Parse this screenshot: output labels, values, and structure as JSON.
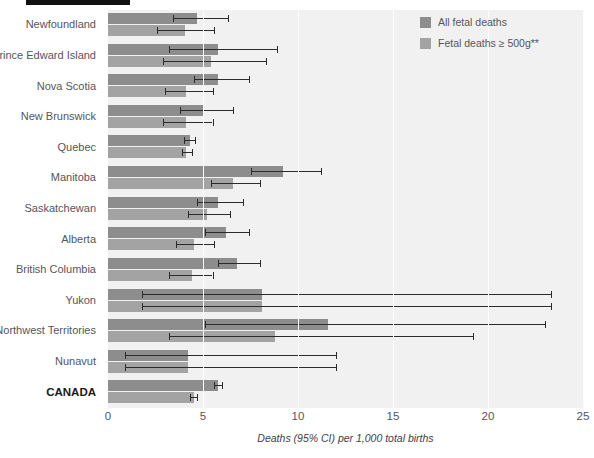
{
  "figure": {
    "title_tag": "",
    "title_clipped": "",
    "legend": [
      {
        "label": "All fetal deaths",
        "color": "#8d8d8d",
        "key": "all"
      },
      {
        "label": "Fetal deaths ≥ 500g**",
        "color": "#a3a3a3",
        "key": "ge500g"
      }
    ]
  },
  "chart_data": {
    "type": "bar",
    "orientation": "horizontal",
    "title": "",
    "xlabel": "Deaths (95% CI) per 1,000 total births",
    "ylabel": "",
    "xlim": [
      0,
      25
    ],
    "xticks": [
      0,
      5,
      10,
      15,
      20,
      25
    ],
    "xticklabels": [
      "0",
      "5",
      "10",
      "15",
      "20",
      "25"
    ],
    "grid": true,
    "legend_position": "top-right",
    "error_bars": "95% CI",
    "categories": [
      "Newfoundland",
      "Prince Edward Island",
      "Nova Scotia",
      "New Brunswick",
      "Quebec",
      "Manitoba",
      "Saskatchewan",
      "Alberta",
      "British Columbia",
      "Yukon",
      "Northwest Territories",
      "Nunavut",
      "CANADA"
    ],
    "highlight_category": "CANADA",
    "series": [
      {
        "name": "All fetal deaths",
        "color": "#8d8d8d",
        "values": [
          4.7,
          5.8,
          5.8,
          5.0,
          4.3,
          9.2,
          5.8,
          6.2,
          6.8,
          8.1,
          11.6,
          4.2,
          5.8
        ],
        "ci_low": [
          3.4,
          3.2,
          4.5,
          3.8,
          4.0,
          7.5,
          4.7,
          5.1,
          5.8,
          1.8,
          5.1,
          0.9,
          5.6
        ],
        "ci_high": [
          6.3,
          8.9,
          7.4,
          6.6,
          4.6,
          11.2,
          7.1,
          7.4,
          8.0,
          23.3,
          23.0,
          12.0,
          6.0
        ]
      },
      {
        "name": "Fetal deaths ≥ 500g**",
        "color": "#a3a3a3",
        "values": [
          4.05,
          5.4,
          4.1,
          4.1,
          4.1,
          6.6,
          5.2,
          4.5,
          4.4,
          8.1,
          8.8,
          4.2,
          4.5
        ],
        "ci_low": [
          2.6,
          2.9,
          3.0,
          2.9,
          3.9,
          5.4,
          4.2,
          3.6,
          3.2,
          1.8,
          3.2,
          0.9,
          4.3
        ],
        "ci_high": [
          5.6,
          8.3,
          5.5,
          5.5,
          4.4,
          8.0,
          6.4,
          5.6,
          5.5,
          23.3,
          19.2,
          12.0,
          4.7
        ]
      }
    ]
  }
}
